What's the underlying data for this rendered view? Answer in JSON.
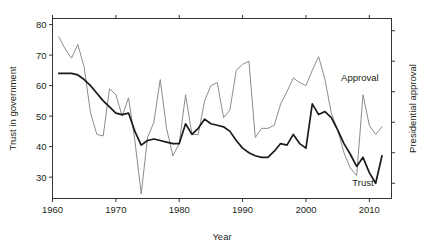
{
  "chart_data": {
    "type": "line",
    "title": "",
    "xlabel": "Year",
    "ylabel": "Trust in government",
    "ylabel_right": "Presidential approval",
    "xlim": [
      1960.0,
      2013.5
    ],
    "ylim": [
      23.0,
      82.0
    ],
    "xticks": [
      1960,
      1970,
      1980,
      1990,
      2000,
      2010
    ],
    "xticklabels": [
      "1960",
      "1970",
      "1980",
      "1990",
      "2000",
      "2010"
    ],
    "yticks": [
      30,
      40,
      50,
      60,
      70,
      80
    ],
    "yticklabels": [
      "30",
      "40",
      "50",
      "60",
      "70",
      "80"
    ],
    "right_axis_ticks_unlabeled": true,
    "grid": false,
    "legend_position": "inline-annotations",
    "series": [
      {
        "name": "Approval",
        "color": "#8c8c8c",
        "annotation_label": "Approval",
        "annotation_x": 2008.5,
        "annotation_y": 61.5,
        "x": [
          1961,
          1962,
          1963,
          1964,
          1965,
          1966,
          1967,
          1968,
          1969,
          1970,
          1971,
          1972,
          1973,
          1974,
          1975,
          1976,
          1977,
          1978,
          1979,
          1980,
          1981,
          1982,
          1983,
          1984,
          1985,
          1986,
          1987,
          1988,
          1989,
          1990,
          1991,
          1992,
          1993,
          1994,
          1995,
          1996,
          1997,
          1998,
          1999,
          2000,
          2001,
          2002,
          2003,
          2004,
          2005,
          2006,
          2007,
          2008,
          2009,
          2010,
          2011,
          2012
        ],
        "values": [
          76.0,
          72.0,
          69.0,
          73.5,
          66.0,
          51.0,
          44.0,
          43.5,
          59.0,
          57.0,
          50.0,
          56.0,
          42.0,
          24.5,
          43.0,
          48.0,
          62.0,
          46.0,
          37.0,
          41.0,
          57.0,
          44.0,
          44.0,
          55.0,
          60.0,
          61.0,
          49.5,
          52.0,
          65.0,
          67.0,
          68.0,
          43.0,
          46.0,
          46.0,
          47.0,
          54.0,
          58.0,
          62.5,
          61.0,
          60.0,
          65.0,
          69.5,
          62.0,
          51.0,
          45.5,
          38.0,
          33.0,
          30.5,
          57.0,
          47.0,
          44.0,
          46.5
        ]
      },
      {
        "name": "Trust",
        "color": "#1a1a1a",
        "annotation_label": "Trust",
        "annotation_x": 2009.0,
        "annotation_y": 27.0,
        "x": [
          1961,
          1962,
          1963,
          1964,
          1965,
          1966,
          1967,
          1968,
          1969,
          1970,
          1971,
          1972,
          1973,
          1974,
          1975,
          1976,
          1977,
          1978,
          1979,
          1980,
          1981,
          1982,
          1983,
          1984,
          1985,
          1986,
          1987,
          1988,
          1989,
          1990,
          1991,
          1992,
          1993,
          1994,
          1995,
          1996,
          1997,
          1998,
          1999,
          2000,
          2001,
          2002,
          2003,
          2004,
          2005,
          2006,
          2007,
          2008,
          2009,
          2010,
          2011,
          2012
        ],
        "values": [
          64.0,
          64.0,
          64.0,
          63.5,
          62.0,
          60.0,
          57.5,
          55.0,
          53.0,
          51.0,
          50.5,
          51.0,
          45.0,
          40.5,
          42.0,
          42.5,
          42.0,
          41.5,
          41.0,
          41.0,
          47.5,
          44.0,
          46.0,
          49.0,
          47.5,
          47.0,
          46.5,
          45.0,
          42.0,
          39.5,
          38.0,
          37.0,
          36.5,
          36.5,
          38.5,
          41.0,
          40.5,
          44.0,
          41.0,
          39.5,
          54.0,
          50.5,
          51.5,
          49.5,
          45.5,
          41.0,
          37.5,
          33.5,
          36.5,
          31.5,
          28.0,
          37.0
        ]
      }
    ]
  },
  "axes": {
    "left_title": "Trust in government",
    "right_title": "Presidential approval",
    "bottom_title": "Year"
  }
}
